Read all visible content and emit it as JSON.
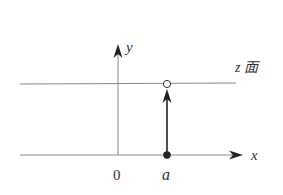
{
  "diagram": {
    "labels": {
      "y_axis": "y",
      "x_axis": "x",
      "origin": "0",
      "point": "a",
      "plane": "z 面"
    },
    "colors": {
      "thin_line": "#888888",
      "thick_line": "#222222",
      "text": "#333333"
    }
  }
}
